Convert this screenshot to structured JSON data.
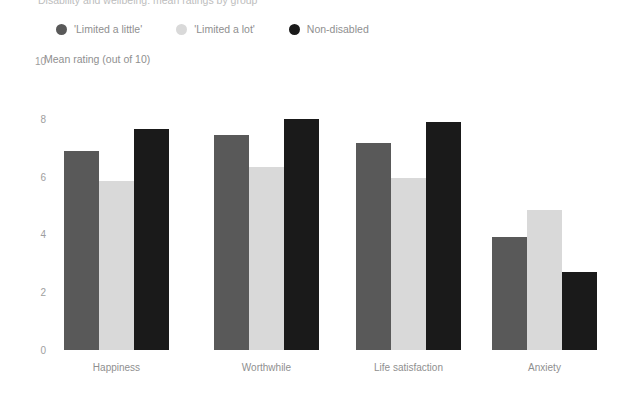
{
  "title_fragment": "Disability and wellbeing: mean ratings by group",
  "axis_title": "Mean rating (out of 10)",
  "legend": [
    {
      "label": "'Limited a little'",
      "color": "#595959",
      "marker": "circle-marker-icon"
    },
    {
      "label": "'Limited a lot'",
      "color": "#d9d9d9",
      "marker": "circle-marker-icon"
    },
    {
      "label": "Non-disabled",
      "color": "#1a1a1a",
      "marker": "circle-marker-icon"
    }
  ],
  "yticks": [
    "0",
    "2",
    "4",
    "6",
    "8",
    "10"
  ],
  "chart_data": {
    "type": "bar",
    "title": "Disability and wellbeing: mean ratings by group",
    "xlabel": "",
    "ylabel": "Mean rating (out of 10)",
    "ylim": [
      0,
      10
    ],
    "ytick_values": [
      0,
      2,
      4,
      6,
      8,
      10
    ],
    "grid": false,
    "legend_position": "top-left",
    "categories": [
      "Happiness",
      "Worthwhile",
      "Life satisfaction",
      "Anxiety"
    ],
    "series": [
      {
        "name": "'Limited a little'",
        "color": "#595959",
        "values": [
          6.9,
          7.45,
          7.15,
          3.9
        ]
      },
      {
        "name": "'Limited a lot'",
        "color": "#d9d9d9",
        "values": [
          5.85,
          6.35,
          5.95,
          4.85
        ]
      },
      {
        "name": "Non-disabled",
        "color": "#1a1a1a",
        "values": [
          7.65,
          8.0,
          7.9,
          2.7
        ]
      }
    ]
  }
}
